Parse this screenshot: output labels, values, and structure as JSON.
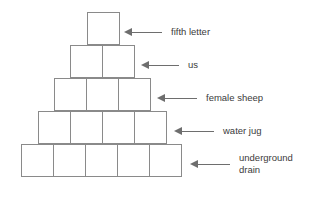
{
  "diagram": {
    "type": "word-pyramid",
    "background_color": "#ffffff",
    "box_border_color": "#8a8a8a",
    "arrow_color": "#6e6e6e",
    "text_color": "#3b3b3b",
    "rows": [
      {
        "index": 1,
        "cells": 1,
        "clue": "fifth letter",
        "arrow_icon": "arrow-left-icon"
      },
      {
        "index": 2,
        "cells": 2,
        "clue": "us",
        "arrow_icon": "arrow-left-icon"
      },
      {
        "index": 3,
        "cells": 3,
        "clue": "female sheep",
        "arrow_icon": "arrow-left-icon"
      },
      {
        "index": 4,
        "cells": 4,
        "clue": "water jug",
        "arrow_icon": "arrow-left-icon"
      },
      {
        "index": 5,
        "cells": 5,
        "clue": "underground\ndrain",
        "arrow_icon": "arrow-left-icon"
      }
    ]
  }
}
